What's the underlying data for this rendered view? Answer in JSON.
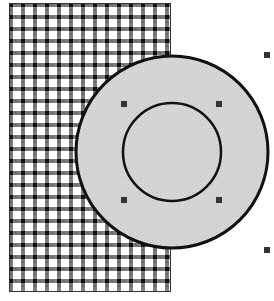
{
  "canvas": {
    "width": 274,
    "height": 301,
    "background": "#ffffff"
  },
  "shapes": {
    "pattern_rect": {
      "x": 9,
      "y": 3,
      "width": 161,
      "height": 288,
      "fill": "gingham-pattern",
      "stroke": "#222222"
    },
    "outer_circle": {
      "cx": 172,
      "cy": 152,
      "r": 96,
      "fill": "#d4d4d4",
      "stroke": "#111111"
    },
    "inner_circle": {
      "cx": 172,
      "cy": 152,
      "r": 49,
      "fill": "#d4d4d4",
      "stroke": "#111111"
    }
  },
  "selection_handles": [
    {
      "x": 124,
      "y": 104
    },
    {
      "x": 219,
      "y": 104
    },
    {
      "x": 124,
      "y": 200
    },
    {
      "x": 219,
      "y": 200
    },
    {
      "x": 267,
      "y": 55
    },
    {
      "x": 267,
      "y": 250
    }
  ],
  "colors": {
    "handle": "#333333",
    "pattern_dark": "#111111",
    "pattern_light": "#ffffff"
  }
}
